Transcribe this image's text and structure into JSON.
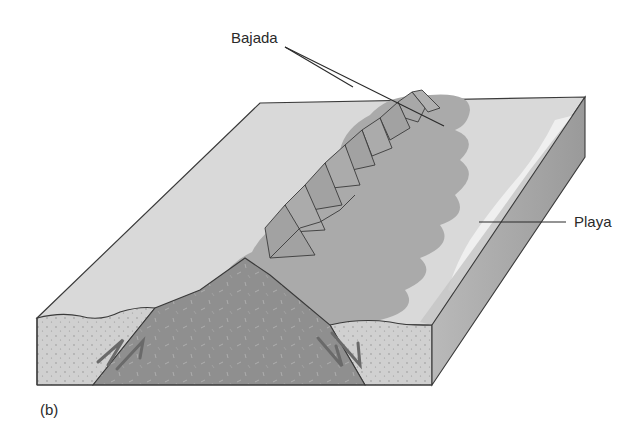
{
  "figure": {
    "panel_label": "(b)",
    "labels": {
      "bajada": "Bajada",
      "playa": "Playa"
    },
    "colors": {
      "plain_surface": "#d9d9d9",
      "bajada_fans": "#a9a9a9",
      "mountain_range": "#9a9a9a",
      "playa": "#ececec",
      "front_face_sediment": "#cfcfcf",
      "side_face": "#a4a4a4",
      "bedrock_core": "#8e8e8e",
      "outline": "#3a3a3a"
    },
    "elements": [
      "block diagram of basin and range",
      "fault-block mountain range with triangular facets",
      "alluvial fans merging into bajada",
      "playa in basin center",
      "normal faults with displacement arrows"
    ]
  }
}
